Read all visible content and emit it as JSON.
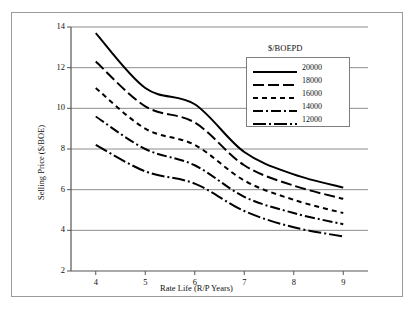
{
  "chart_data": {
    "type": "line",
    "title": "",
    "xlabel": "Rate Life (R/P Years)",
    "ylabel": "Selling Price ($/BOE)",
    "legend_title": "$/BOEPD",
    "legend_position": "inside-top-right",
    "grid": "horizontal",
    "xlim": [
      3.5,
      9.5
    ],
    "ylim": [
      2,
      14
    ],
    "xticks": [
      "4",
      "5",
      "6",
      "7",
      "8",
      "9"
    ],
    "xtick_values": [
      4,
      5,
      6,
      7,
      8,
      9
    ],
    "yticks": [
      "2",
      "4",
      "6",
      "8",
      "10",
      "12",
      "14"
    ],
    "ytick_values": [
      2,
      4,
      6,
      8,
      10,
      12,
      14
    ],
    "x": [
      4,
      5,
      6,
      7,
      8,
      9
    ],
    "series": [
      {
        "name": "20000",
        "dash": "solid",
        "color": "#000000",
        "values": [
          13.7,
          11.0,
          10.2,
          7.85,
          6.75,
          6.1
        ]
      },
      {
        "name": "18000",
        "dash": "long-dash",
        "color": "#000000",
        "values": [
          12.3,
          10.1,
          9.3,
          7.2,
          6.2,
          5.55
        ]
      },
      {
        "name": "16000",
        "dash": "short-dash",
        "color": "#000000",
        "values": [
          11.0,
          9.0,
          8.2,
          6.45,
          5.5,
          4.85
        ]
      },
      {
        "name": "14000",
        "dash": "dash-dot",
        "color": "#000000",
        "values": [
          9.6,
          8.0,
          7.2,
          5.65,
          4.85,
          4.3
        ]
      },
      {
        "name": "12000",
        "dash": "long-dash-dot",
        "color": "#000000",
        "values": [
          8.2,
          6.9,
          6.3,
          4.95,
          4.15,
          3.7
        ]
      }
    ]
  }
}
